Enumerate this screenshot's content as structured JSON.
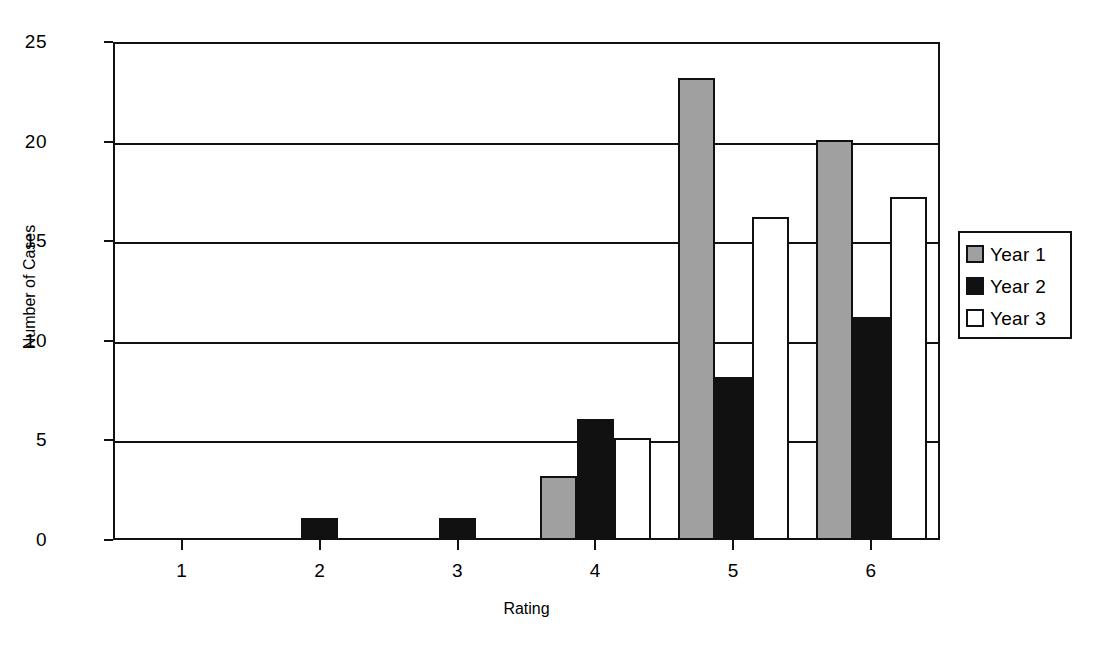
{
  "chart_data": {
    "type": "bar",
    "title": "",
    "xlabel": "Rating",
    "ylabel": "Number of Cases",
    "categories": [
      "1",
      "2",
      "3",
      "4",
      "5",
      "6"
    ],
    "series": [
      {
        "name": "Year 1",
        "color": "#a0a0a0",
        "values": [
          0,
          0,
          0,
          3.2,
          23.2,
          20.1
        ]
      },
      {
        "name": "Year 2",
        "color": "#111111",
        "values": [
          0,
          1.1,
          1.1,
          6.1,
          8.2,
          11.2
        ]
      },
      {
        "name": "Year 3",
        "color": "#ffffff",
        "values": [
          0,
          0,
          0,
          5.1,
          16.2,
          17.2
        ]
      }
    ],
    "ylim": [
      0,
      25
    ],
    "yticks": [
      0,
      5,
      10,
      15,
      20,
      25
    ],
    "ytick_labels": [
      "0",
      "5",
      "10",
      "15",
      "20",
      "25"
    ],
    "grid": true,
    "legend_position": "right",
    "legend_entries": [
      "Year 1",
      "Year 2",
      "Year 3"
    ]
  },
  "legend": {
    "items": [
      {
        "label": "Year 1",
        "swatch": "gray-swatch-icon"
      },
      {
        "label": "Year 2",
        "swatch": "black-swatch-icon"
      },
      {
        "label": "Year 3",
        "swatch": "white-swatch-icon"
      }
    ]
  },
  "colors": {
    "year1": "#a0a0a0",
    "year2": "#111111",
    "year3": "#ffffff",
    "outline": "#111111",
    "background": "#ffffff"
  }
}
